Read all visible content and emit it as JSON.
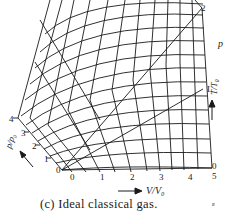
{
  "figure": {
    "caption": "(c) Ideal classical gas.",
    "axes": {
      "volume": {
        "label": "V/V₀",
        "ticks": [
          "0",
          "1",
          "2",
          "3",
          "4",
          "5"
        ]
      },
      "pressure": {
        "label": "p/p₀",
        "ticks": [
          "0",
          "1",
          "2",
          "3",
          "4"
        ]
      },
      "temperature": {
        "label": "T/T₀",
        "ticks": [
          "0",
          "L",
          "2"
        ]
      }
    },
    "corner_labels": {
      "bottom_left": "0",
      "bottom_right": "0",
      "mid_right": "L",
      "top_right": "2"
    },
    "margin_marks": {
      "right_p": "p",
      "bottom_right_mark": "ε"
    },
    "line_color": "#1a1a1a"
  }
}
